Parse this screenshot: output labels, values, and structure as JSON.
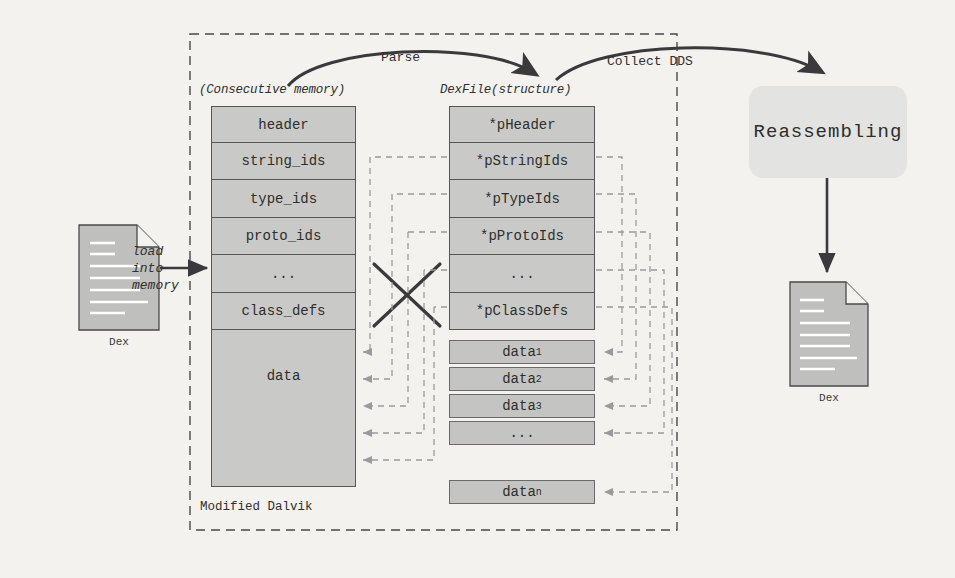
{
  "diagram": {
    "boundary_label": "Modified Dalvik",
    "captions": {
      "memory": "(Consecutive memory)",
      "dexfile": "DexFile(structure)"
    },
    "arrows": {
      "parse": "Parse",
      "collect": "Collect DDS",
      "load": "load\ninto\nmemory",
      "load_line1": "load",
      "load_line2": "into",
      "load_line3": "memory"
    },
    "input_file": {
      "label": "Dex"
    },
    "output_file": {
      "label": "Dex"
    },
    "process_box": {
      "label": "Reassembling"
    },
    "memory_column": {
      "cells": [
        {
          "label": "header",
          "struck": true
        },
        {
          "label": "string_ids",
          "struck": false
        },
        {
          "label": "type_ids",
          "struck": false
        },
        {
          "label": "proto_ids",
          "struck": false
        },
        {
          "label": "...",
          "struck": false
        },
        {
          "label": "class_defs",
          "struck": false
        },
        {
          "label": "data",
          "struck": true
        }
      ]
    },
    "dexfile_column": {
      "cells": [
        {
          "label": "*pHeader"
        },
        {
          "label": "*pStringIds"
        },
        {
          "label": "*pTypeIds"
        },
        {
          "label": "*pProtoIds"
        },
        {
          "label": "..."
        },
        {
          "label": "*pClassDefs"
        }
      ]
    },
    "data_blocks": [
      {
        "base": "data",
        "sub": "1"
      },
      {
        "base": "data",
        "sub": "2"
      },
      {
        "base": "data",
        "sub": "3"
      },
      {
        "base": "...",
        "sub": ""
      },
      {
        "base": "data",
        "sub": "n"
      }
    ],
    "colors": {
      "background": "#f3f2ef",
      "cell_fill": "#c9c9c7",
      "cell_stroke": "#57575a",
      "data_fill": "#c4c4c2",
      "process_fill": "#e3e3e1",
      "file_fill": "#bfbfbd",
      "arrow_dark": "#3a3a3c",
      "dashed_gray": "#9a9a9c",
      "boundary_dash": "#4a4a4c"
    }
  }
}
